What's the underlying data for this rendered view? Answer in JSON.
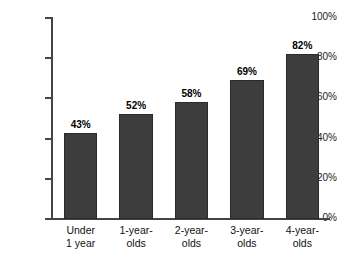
{
  "chart_data": {
    "type": "bar",
    "title": "",
    "subtitle": "",
    "xlabel": "",
    "ylabel": "",
    "categories": [
      "Under 1 year",
      "1-year-olds",
      "2-year-olds",
      "3-year-olds",
      "4-year-olds"
    ],
    "category_lines": [
      [
        "Under",
        "1 year"
      ],
      [
        "1-year-",
        "olds"
      ],
      [
        "2-year-",
        "olds"
      ],
      [
        "3-year-",
        "olds"
      ],
      [
        "4-year-",
        "olds"
      ]
    ],
    "values": [
      43,
      52,
      58,
      69,
      82
    ],
    "value_labels": [
      "43%",
      "52%",
      "58%",
      "69%",
      "82%"
    ],
    "ylim": [
      0,
      100
    ],
    "ytick_values": [
      0,
      20,
      40,
      60,
      80,
      100
    ],
    "ytick_labels": [
      "0%",
      "20%",
      "40%",
      "60%",
      "80%",
      "100%"
    ],
    "grid": false,
    "legend": false,
    "legend_position": "none",
    "bar_color": "#3d3d3d",
    "bar_border_color": "#2a2a2a",
    "axis_color": "#444444",
    "label_color": "#000000",
    "background_color": "#ffffff"
  }
}
